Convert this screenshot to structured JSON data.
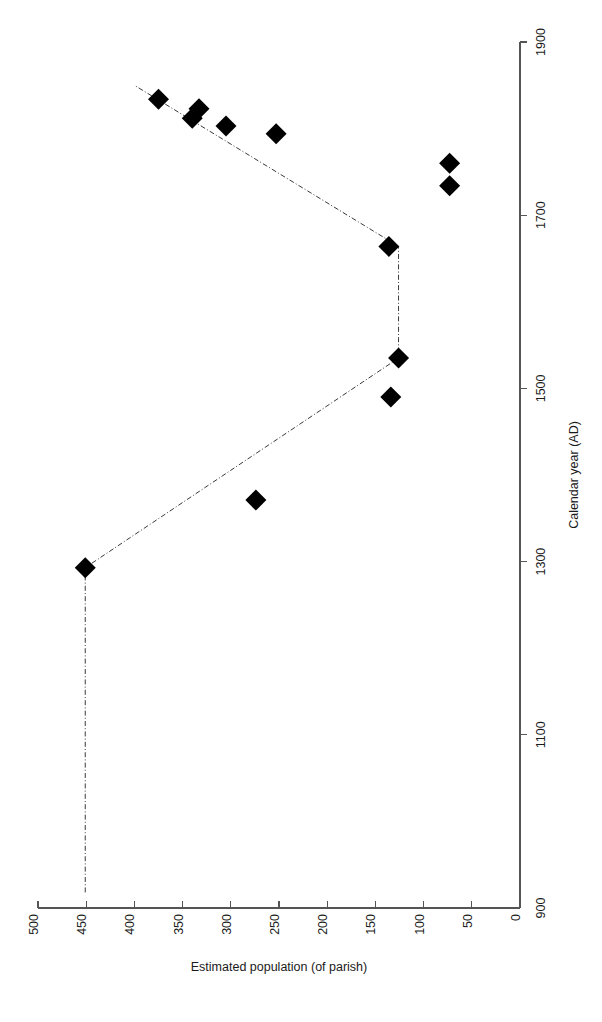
{
  "chart_data": {
    "type": "scatter",
    "title": "",
    "orientation": "rotated-90",
    "xlabel": "Estimated population (of parish)",
    "ylabel": "Calendar year (AD)",
    "x_axis": {
      "label": "Estimated population (of parish)",
      "ticks": [
        500,
        450,
        400,
        350,
        300,
        250,
        200,
        150,
        100,
        50,
        0
      ],
      "tick_labels": [
        "500",
        "450",
        "400",
        "350",
        "300",
        "250",
        "200",
        "150",
        "100",
        "50",
        "0"
      ],
      "range": [
        500,
        0
      ],
      "direction": "descending-left-to-right"
    },
    "y_axis": {
      "label": "Calendar year (AD)",
      "ticks": [
        900,
        1100,
        1300,
        1500,
        1700,
        1900
      ],
      "tick_labels": [
        "900",
        "1100",
        "1300",
        "1500",
        "1700",
        "1900"
      ],
      "range": [
        900,
        1900
      ],
      "direction": "ascending-bottom-to-top"
    },
    "grid": false,
    "legend": null,
    "series": [
      {
        "name": "Estimated parish population",
        "marker": "filled-diamond",
        "marker_color": "#000000",
        "points": [
          {
            "year": 1293,
            "population": 451
          },
          {
            "year": 1371,
            "population": 274
          },
          {
            "year": 1490,
            "population": 134
          },
          {
            "year": 1535,
            "population": 126
          },
          {
            "year": 1664,
            "population": 136
          },
          {
            "year": 1734,
            "population": 73
          },
          {
            "year": 1760,
            "population": 73
          },
          {
            "year": 1794,
            "population": 253
          },
          {
            "year": 1803,
            "population": 305
          },
          {
            "year": 1812,
            "population": 340
          },
          {
            "year": 1823,
            "population": 333
          },
          {
            "year": 1834,
            "population": 375
          }
        ]
      }
    ],
    "trend_line": {
      "style": "dash-dot",
      "color": "#3a3a3a",
      "vertices": [
        {
          "year": 918,
          "population": 451
        },
        {
          "year": 1293,
          "population": 451
        },
        {
          "year": 1535,
          "population": 126
        },
        {
          "year": 1664,
          "population": 126
        },
        {
          "year": 1850,
          "population": 400
        }
      ]
    }
  }
}
